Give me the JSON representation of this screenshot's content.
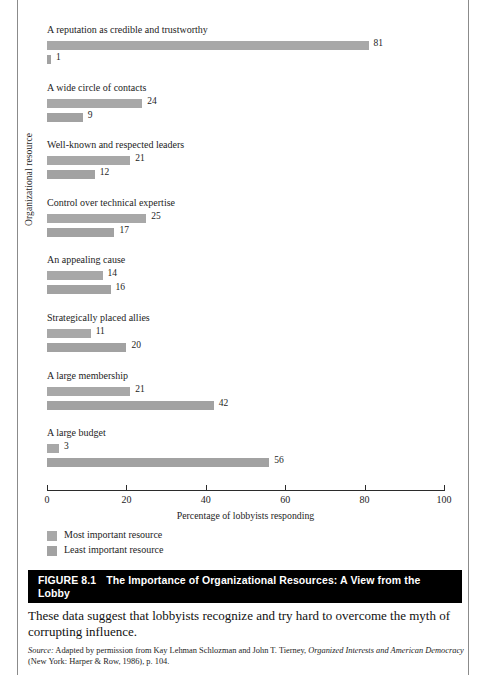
{
  "chart_data": {
    "type": "bar",
    "orientation": "horizontal",
    "title": "The Importance of Organizational Resources: A View from the Lobby",
    "xlabel": "Percentage of lobbyists responding",
    "ylabel": "Organizational resource",
    "xlim": [
      0,
      100
    ],
    "xticks": [
      0,
      20,
      40,
      60,
      80,
      100
    ],
    "grid": false,
    "legend_position": "below-axis-left",
    "categories": [
      "A reputation as credible and trustworthy",
      "A wide circle of contacts",
      "Well-known and respected leaders",
      "Control over technical expertise",
      "An appealing cause",
      "Strategically placed allies",
      "A large membership",
      "A large budget"
    ],
    "series": [
      {
        "name": "Most important resource",
        "color": "#a8a8a8",
        "values": [
          81,
          24,
          21,
          25,
          14,
          11,
          21,
          3
        ]
      },
      {
        "name": "Least important resource",
        "color": "#a2a2a2",
        "values": [
          1,
          9,
          12,
          17,
          16,
          20,
          42,
          56
        ]
      }
    ]
  },
  "axis": {
    "tick_labels": [
      "0",
      "20",
      "40",
      "60",
      "80",
      "100"
    ],
    "x_axis_title": "Percentage of lobbyists responding",
    "y_axis_title": "Organizational resource"
  },
  "legend": {
    "items": [
      {
        "label": "Most important resource"
      },
      {
        "label": "Least important resource"
      }
    ]
  },
  "caption": {
    "figure_number": "FIGURE 8.1",
    "figure_title": "The Importance of Organizational Resources: A View from the",
    "figure_title_cont": "Lobby"
  },
  "blurb": {
    "text": "These data suggest that lobbyists recognize and try hard to overcome the myth of corrupting influence."
  },
  "source": {
    "lead": "Source:",
    "part1": " Adapted by permission from Kay Lehman Schlozman and John T. Tierney, ",
    "title1": "Organized Interests",
    "title2": "and American Democracy",
    "part2": " (New York: Harper & Row, 1986), p. 104."
  },
  "colors": {
    "bar_most": "#a8a8a8",
    "bar_least": "#a2a2a2",
    "caption_bg": "#000000",
    "caption_fg": "#ffffff",
    "axis": "#2b2b2b"
  }
}
